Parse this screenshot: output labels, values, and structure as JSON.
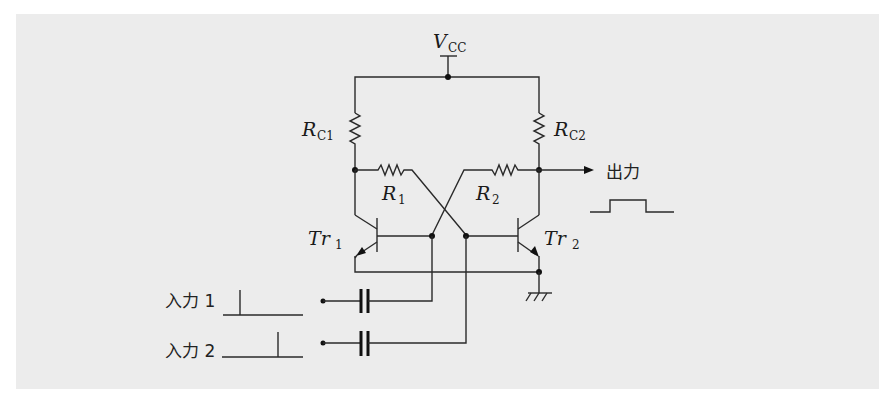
{
  "diagram": {
    "type": "astable/monostable transistor flip-flop circuit",
    "supply": {
      "label": "V",
      "sub": "CC"
    },
    "resistors": [
      {
        "id": "rc1",
        "label": "R",
        "sub": "C1"
      },
      {
        "id": "rc2",
        "label": "R",
        "sub": "C2"
      },
      {
        "id": "r1",
        "label": "R",
        "sub": "1"
      },
      {
        "id": "r2",
        "label": "R",
        "sub": "2"
      }
    ],
    "transistors": [
      {
        "id": "tr1",
        "label": "Tr",
        "sub": "1"
      },
      {
        "id": "tr2",
        "label": "Tr",
        "sub": "2"
      }
    ],
    "inputs": [
      {
        "label": "入力 1"
      },
      {
        "label": "入力 2"
      }
    ],
    "output": {
      "label": "出力"
    }
  }
}
